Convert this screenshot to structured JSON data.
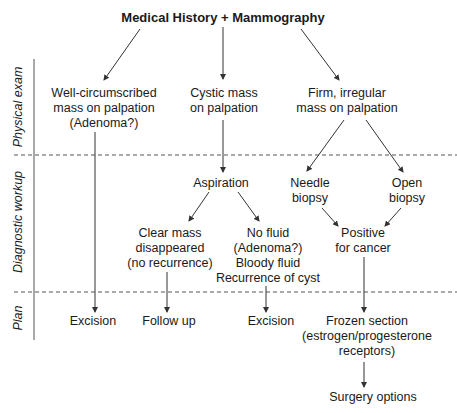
{
  "title": "Medical History + Mammography",
  "lanes": [
    {
      "label": "Physical exam",
      "cy": 107
    },
    {
      "label": "Diagnostic workup",
      "cy": 222
    },
    {
      "label": "Plan",
      "cy": 318
    }
  ],
  "nodes": {
    "well_circumscribed": "Well-circumscribed\nmass on palpation\n(Adenoma?)",
    "cystic_mass": "Cystic mass\non palpation",
    "firm_irregular": "Firm, irregular\nmass on palpation",
    "aspiration": "Aspiration",
    "needle_biopsy": "Needle\nbiopsy",
    "open_biopsy": "Open\nbiopsy",
    "clear_mass": "Clear mass\ndisappeared\n(no recurrence)",
    "no_fluid": "No fluid\n(Adenoma?)\nBloody fluid\nRecurrence of cyst",
    "positive_cancer": "Positive\nfor cancer",
    "excision_1": "Excision",
    "follow_up": "Follow up",
    "excision_2": "Excision",
    "frozen_section": "Frozen section\n(estrogen/progesterone\nreceptors)",
    "surgery_options": "Surgery options"
  },
  "colors": {
    "line": "#333333",
    "text": "#1a1a1a",
    "background": "#ffffff"
  }
}
